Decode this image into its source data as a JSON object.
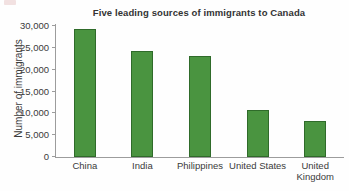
{
  "chart_data": {
    "type": "bar",
    "title": "Five leading sources of immigrants to Canada",
    "xlabel": "",
    "ylabel": "Number of immigrants",
    "categories": [
      "China",
      "India",
      "Philippines",
      "United States",
      "United Kingdom"
    ],
    "category_lines": [
      [
        "China"
      ],
      [
        "India"
      ],
      [
        "Philippines"
      ],
      [
        "United States"
      ],
      [
        "United",
        "Kingdom"
      ]
    ],
    "values": [
      29300,
      24300,
      23200,
      10700,
      8200
    ],
    "ylim": [
      0,
      30000
    ],
    "ytick_values": [
      0,
      5000,
      10000,
      15000,
      20000,
      25000,
      30000
    ],
    "ytick_labels": [
      "0",
      "5,000",
      "10,000",
      "15,000",
      "20,000",
      "25,000",
      "30,000"
    ],
    "grid": false,
    "legend": false,
    "bar_color": "#4a9440",
    "bar_edge_color": "#2f6b2a",
    "axis_color": "#9c9c9c",
    "text_color": "#3a3a3a"
  }
}
